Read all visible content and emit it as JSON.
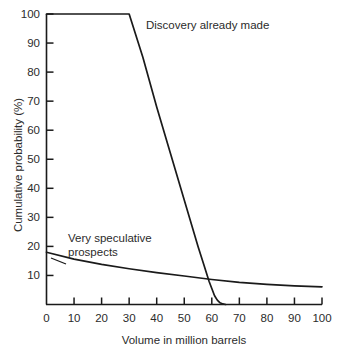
{
  "chart_data": {
    "type": "line",
    "title": "",
    "xlabel": "Volume in million barrels",
    "ylabel": "Cumulative probability (%)",
    "xlim": [
      0,
      100
    ],
    "ylim": [
      0,
      100
    ],
    "grid": false,
    "legend_position": "inline-annotations",
    "xticks": [
      0,
      10,
      20,
      30,
      40,
      50,
      60,
      70,
      80,
      90,
      100
    ],
    "xtick_labels": [
      "0",
      "10",
      "20",
      "30",
      "40",
      "50",
      "60",
      "70",
      "80",
      "90",
      "100"
    ],
    "yticks": [
      10,
      20,
      30,
      40,
      50,
      60,
      70,
      80,
      90,
      100
    ],
    "ytick_labels": [
      "10",
      "20",
      "30",
      "40",
      "50",
      "60",
      "70",
      "80",
      "90",
      "100"
    ],
    "series": [
      {
        "name": "Discovery already made",
        "x": [
          0,
          10,
          20,
          28,
          30,
          35,
          40,
          45,
          50,
          55,
          57,
          58,
          59,
          60,
          61,
          62,
          63,
          64,
          65
        ],
        "values": [
          100,
          100,
          100,
          100,
          100,
          85,
          68,
          52,
          36,
          20,
          14,
          11,
          8,
          5.5,
          3,
          1.5,
          0.6,
          0.2,
          0
        ]
      },
      {
        "name": "Very speculative prospects",
        "x": [
          0,
          10,
          20,
          30,
          40,
          50,
          60,
          70,
          80,
          90,
          100
        ],
        "values": [
          18,
          15.6,
          13.8,
          12.3,
          11.0,
          9.8,
          8.6,
          7.6,
          6.9,
          6.4,
          6.1
        ]
      }
    ],
    "annotations": [
      {
        "text": "Discovery already made",
        "series": "Discovery already made"
      },
      {
        "text": "Very speculative\nprospects",
        "series": "Very speculative prospects"
      }
    ],
    "colors": {
      "line": "#1a1a1a",
      "axis": "#1a1a1a",
      "text": "#2b2b2b",
      "background": "#ffffff"
    }
  }
}
